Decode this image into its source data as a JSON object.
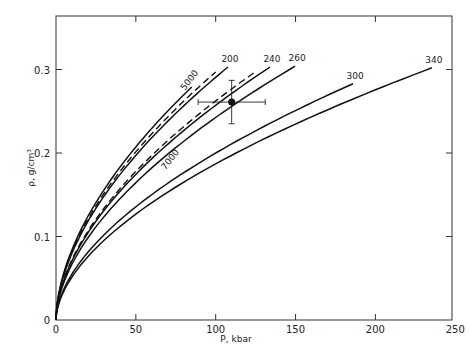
{
  "chart_data": {
    "type": "line",
    "title": "",
    "xlabel": "P, kbar",
    "ylabel": "ρ, g/cm³",
    "xlim": [
      0,
      250
    ],
    "ylim": [
      0,
      0.35
    ],
    "xticks": [
      0,
      50,
      100,
      150,
      200,
      250
    ],
    "xtick_labels": [
      "0",
      "50",
      "100",
      "150",
      "200",
      "250"
    ],
    "yticks": [
      0,
      0.1,
      0.2,
      0.3
    ],
    "ytick_labels": [
      "0",
      "0.1",
      "0.2",
      "0.3"
    ],
    "grid": false,
    "legend": null,
    "series": [
      {
        "name": "unlabeled",
        "style": "solid",
        "x": [
          0,
          5,
          10,
          20,
          40,
          60,
          85
        ],
        "y": [
          0,
          0.044,
          0.066,
          0.099,
          0.149,
          0.191,
          0.279
        ],
        "end": [
          85,
          0.279
        ]
      },
      {
        "name": "5000",
        "style": "dashed",
        "end": [
          100,
          0.297
        ]
      },
      {
        "name": "200",
        "style": "solid",
        "end": [
          107.7,
          0.303
        ]
      },
      {
        "name": "7000",
        "style": "dashed",
        "end": [
          124,
          0.296
        ]
      },
      {
        "name": "240",
        "style": "solid",
        "end": [
          134,
          0.303
        ]
      },
      {
        "name": "260",
        "style": "solid",
        "end": [
          149.7,
          0.304
        ]
      },
      {
        "name": "300",
        "style": "solid",
        "end": [
          186,
          0.283
        ]
      },
      {
        "name": "340",
        "style": "solid",
        "end": [
          235.4,
          0.302
        ]
      }
    ],
    "annotations": [
      {
        "text": "5000",
        "x": 85,
        "y": 0.285,
        "rotation": -52
      },
      {
        "text": "7000",
        "x": 73,
        "y": 0.19,
        "rotation": -52
      },
      {
        "text": "200",
        "at_series_end": "200"
      },
      {
        "text": "240",
        "at_series_end": "240"
      },
      {
        "text": "260",
        "at_series_end": "260"
      },
      {
        "text": "300",
        "at_series_end": "300"
      },
      {
        "text": "340",
        "at_series_end": "340"
      }
    ],
    "data_point": {
      "x": 110,
      "y": 0.261,
      "xerr": 21,
      "yerr": 0.026
    }
  }
}
